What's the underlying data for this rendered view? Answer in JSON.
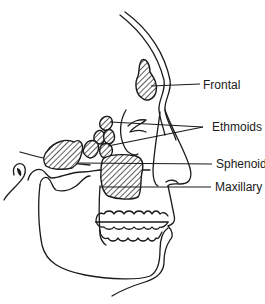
{
  "diagram": {
    "labels": {
      "frontal": "Frontal",
      "ethmoids": "Ethmoids",
      "sphenoid": "Sphenoid",
      "maxillary": "Maxillary"
    },
    "colors": {
      "line": "#1a1a1a",
      "background": "#ffffff"
    }
  }
}
